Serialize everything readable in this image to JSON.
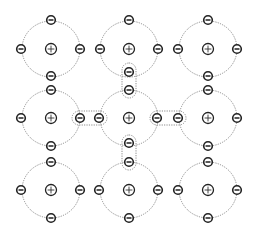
{
  "diagram": {
    "title": "",
    "colors": {
      "background": "#ffffff",
      "stroke": "#222222",
      "orbit": "#8a8a8a"
    },
    "nucleus_symbol": "+",
    "electron_symbol": "−",
    "atoms": [
      {
        "id": "atom-r0-c0",
        "cx": 51,
        "cy": 49,
        "rx": 29,
        "ry": 28,
        "electrons": [
          [
            51,
            20
          ],
          [
            51,
            76
          ],
          [
            21,
            49
          ],
          [
            80,
            49
          ]
        ]
      },
      {
        "id": "atom-r0-c1",
        "cx": 129,
        "cy": 49,
        "rx": 29,
        "ry": 28,
        "electrons": [
          [
            129,
            20
          ],
          [
            129,
            72
          ],
          [
            100,
            49
          ],
          [
            158,
            49
          ]
        ]
      },
      {
        "id": "atom-r0-c2",
        "cx": 208,
        "cy": 49,
        "rx": 29,
        "ry": 28,
        "electrons": [
          [
            208,
            20
          ],
          [
            208,
            76
          ],
          [
            178,
            49
          ],
          [
            237,
            49
          ]
        ]
      },
      {
        "id": "atom-r1-c0",
        "cx": 51,
        "cy": 118,
        "rx": 29,
        "ry": 28,
        "electrons": [
          [
            51,
            90
          ],
          [
            51,
            146
          ],
          [
            21,
            118
          ],
          [
            80,
            118
          ]
        ]
      },
      {
        "id": "atom-r1-c1",
        "cx": 129,
        "cy": 118,
        "rx": 29,
        "ry": 28,
        "electrons": [
          [
            129,
            90
          ],
          [
            129,
            143
          ],
          [
            99,
            118
          ],
          [
            157,
            118
          ]
        ]
      },
      {
        "id": "atom-r1-c2",
        "cx": 208,
        "cy": 118,
        "rx": 29,
        "ry": 28,
        "electrons": [
          [
            208,
            90
          ],
          [
            208,
            146
          ],
          [
            178,
            118
          ],
          [
            237,
            118
          ]
        ]
      },
      {
        "id": "atom-r2-c0",
        "cx": 51,
        "cy": 190,
        "rx": 29,
        "ry": 28,
        "electrons": [
          [
            51,
            162
          ],
          [
            51,
            218
          ],
          [
            21,
            190
          ],
          [
            80,
            190
          ]
        ]
      },
      {
        "id": "atom-r2-c1",
        "cx": 129,
        "cy": 190,
        "rx": 29,
        "ry": 28,
        "electrons": [
          [
            129,
            162
          ],
          [
            129,
            218
          ],
          [
            99,
            190
          ],
          [
            158,
            190
          ]
        ]
      },
      {
        "id": "atom-r2-c2",
        "cx": 208,
        "cy": 190,
        "rx": 29,
        "ry": 28,
        "electrons": [
          [
            208,
            162
          ],
          [
            208,
            218
          ],
          [
            178,
            190
          ],
          [
            237,
            190
          ]
        ]
      }
    ],
    "bonds": [
      {
        "id": "bond-left",
        "orientation": "horizontal",
        "x": 72,
        "y": 111,
        "w": 35,
        "h": 14
      },
      {
        "id": "bond-right",
        "orientation": "horizontal",
        "x": 150,
        "y": 111,
        "w": 36,
        "h": 14
      },
      {
        "id": "bond-top",
        "orientation": "vertical",
        "x": 122,
        "y": 63,
        "w": 14,
        "h": 35
      },
      {
        "id": "bond-bottom",
        "orientation": "vertical",
        "x": 122,
        "y": 135,
        "w": 14,
        "h": 35
      }
    ]
  }
}
